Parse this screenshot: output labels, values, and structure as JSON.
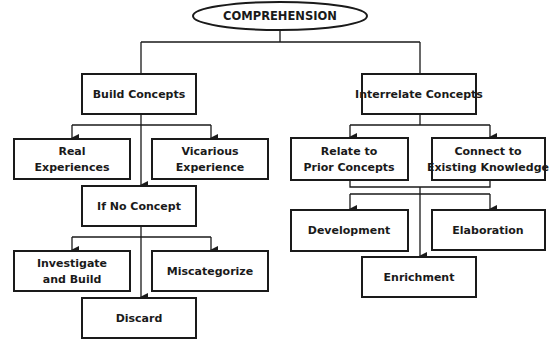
{
  "diagram": {
    "title": "COMPREHENSION",
    "nodes": {
      "build_concepts": [
        "Build Concepts"
      ],
      "interrelate_concepts": [
        "Interrelate Concepts"
      ],
      "real_experiences": [
        "Real",
        "Experiences"
      ],
      "vicarious_experience": [
        "Vicarious",
        "Experience"
      ],
      "if_no_concept": [
        "If No Concept"
      ],
      "investigate_and_build": [
        "Investigate",
        "and Build"
      ],
      "miscategorize": [
        "Miscategorize"
      ],
      "discard": [
        "Discard"
      ],
      "relate_prior": [
        "Relate to",
        "Prior Concepts"
      ],
      "connect_existing": [
        "Connect to",
        "Existing Knowledge"
      ],
      "development": [
        "Development"
      ],
      "elaboration": [
        "Elaboration"
      ],
      "enrichment": [
        "Enrichment"
      ]
    },
    "edges": [
      [
        "comprehension",
        "build_concepts"
      ],
      [
        "comprehension",
        "interrelate_concepts"
      ],
      [
        "build_concepts",
        "real_experiences"
      ],
      [
        "build_concepts",
        "vicarious_experience"
      ],
      [
        "build_concepts",
        "if_no_concept"
      ],
      [
        "if_no_concept",
        "investigate_and_build"
      ],
      [
        "if_no_concept",
        "miscategorize"
      ],
      [
        "if_no_concept",
        "discard"
      ],
      [
        "interrelate_concepts",
        "relate_prior"
      ],
      [
        "interrelate_concepts",
        "connect_existing"
      ],
      [
        "relate_prior",
        "development"
      ],
      [
        "relate_prior",
        "elaboration"
      ],
      [
        "relate_prior",
        "enrichment"
      ],
      [
        "connect_existing",
        "development"
      ],
      [
        "connect_existing",
        "elaboration"
      ],
      [
        "connect_existing",
        "enrichment"
      ]
    ]
  }
}
